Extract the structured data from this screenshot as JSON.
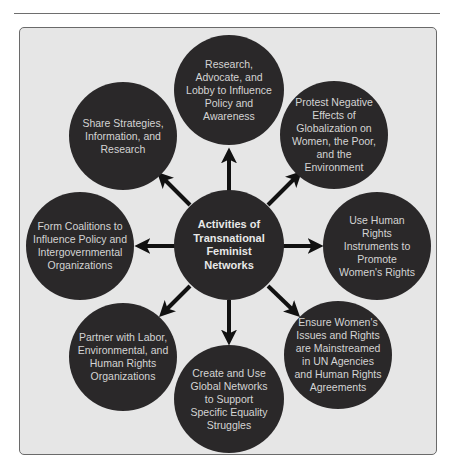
{
  "diagram": {
    "type": "hub-and-spoke",
    "center": {
      "label": "Activities of Transnational Feminist Networks"
    },
    "nodes": [
      {
        "id": "top",
        "label": "Research, Advocate, and Lobby to Influence Policy and Awareness"
      },
      {
        "id": "top-right",
        "label": "Protest Negative Effects of Globalization on Women, the Poor, and the Environment"
      },
      {
        "id": "right",
        "label": "Use Human Rights Instruments to Promote Women's Rights"
      },
      {
        "id": "bottom-right",
        "label": "Ensure Women's Issues and Rights are Mainstreamed in UN Agencies and Human Rights Agreements"
      },
      {
        "id": "bottom",
        "label": "Create and Use Global Networks to Support Specific Equality Struggles"
      },
      {
        "id": "bottom-left",
        "label": "Partner with Labor, Environmental, and Human Rights Organizations"
      },
      {
        "id": "left",
        "label": "Form Coalitions to Influence Policy and Intergovernmental Organizations"
      },
      {
        "id": "top-left",
        "label": "Share Strategies, Information, and Research"
      }
    ],
    "edges_direction": "center-to-outer",
    "colors": {
      "circle_fill": "#2a2829",
      "circle_text": "#d4d4d4",
      "frame_background": "#e6e6e6",
      "frame_border": "#6a6a6a",
      "arrow": "#111111"
    }
  }
}
